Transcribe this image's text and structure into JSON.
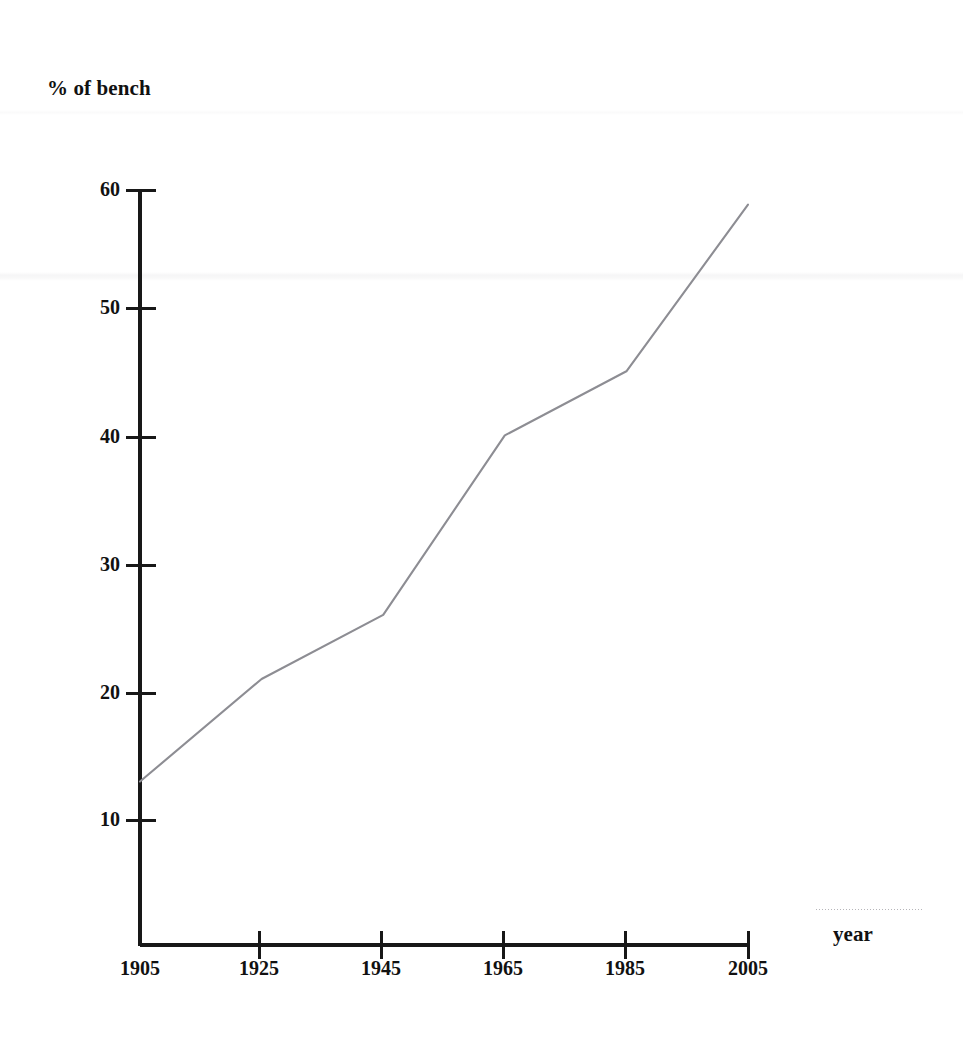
{
  "chart_data": {
    "type": "line",
    "title": "",
    "xlabel": "year",
    "ylabel": "% of bench",
    "x": [
      1905,
      1925,
      1945,
      1965,
      1985,
      2005
    ],
    "values": [
      13,
      21,
      26,
      40,
      45,
      58
    ],
    "series": [
      {
        "name": "% of bench",
        "x": [
          1905,
          1925,
          1945,
          1965,
          1985,
          2005
        ],
        "values": [
          13,
          21,
          26,
          40,
          45,
          58
        ]
      }
    ],
    "xlim": [
      1905,
      2005
    ],
    "ylim": [
      0,
      60
    ],
    "x_tick_labels": [
      "1905",
      "1925",
      "1945",
      "1965",
      "1985",
      "2005"
    ],
    "y_tick_labels": [
      "10",
      "20",
      "30",
      "40",
      "50",
      "60"
    ],
    "y_ticks": [
      10,
      20,
      30,
      40,
      50,
      60
    ],
    "grid": false,
    "legend": false,
    "legend_position": "none",
    "line_color": "#8d8d93",
    "axis_color": "#181818",
    "background_color": "#ffffff",
    "markers": false,
    "annotations": []
  },
  "axes": {
    "y_title": "% of bench",
    "x_title": "year"
  }
}
